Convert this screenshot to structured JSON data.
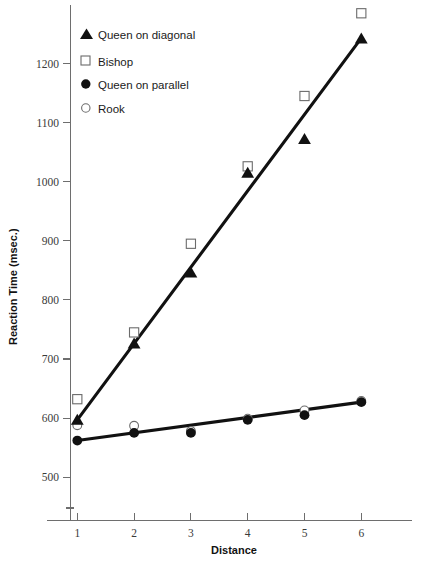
{
  "chart_data": {
    "type": "scatter",
    "title": "",
    "xlabel": "Distance",
    "ylabel": "Reaction Time (msec.)",
    "x": [
      1,
      2,
      3,
      4,
      5,
      6
    ],
    "xticklabels": [
      "1",
      "2",
      "3",
      "4",
      "5",
      "6"
    ],
    "xlim": [
      0.6,
      6.5
    ],
    "yticks": [
      500,
      600,
      700,
      800,
      900,
      1000,
      1100,
      1200
    ],
    "yticklabels": [
      "500",
      "600",
      "700",
      "800",
      "900",
      "1000",
      "1100",
      "1200"
    ],
    "ylim": [
      455,
      1300
    ],
    "grid": false,
    "legend_position": "top-left",
    "series": [
      {
        "name": "Queen on diagonal",
        "marker": "filled-triangle",
        "has_fit_line": true,
        "values": [
          598,
          727,
          847,
          1016,
          1073,
          1243
        ]
      },
      {
        "name": "Bishop",
        "marker": "open-square",
        "has_fit_line": false,
        "values": [
          632,
          745,
          895,
          1026,
          1145,
          1285
        ]
      },
      {
        "name": "Queen on parallel",
        "marker": "filled-circle",
        "has_fit_line": true,
        "values": [
          562,
          575,
          575,
          597,
          605,
          627
        ]
      },
      {
        "name": "Rook",
        "marker": "open-circle",
        "has_fit_line": false,
        "values": [
          588,
          587,
          578,
          599,
          613,
          629
        ]
      }
    ],
    "fit_lines": [
      {
        "name": "diagonal-fit",
        "x": [
          1,
          6
        ],
        "y": [
          597,
          1243
        ]
      },
      {
        "name": "parallel-fit",
        "x": [
          1,
          6
        ],
        "y": [
          562,
          627
        ]
      }
    ]
  },
  "legend": {
    "items": [
      {
        "marker": "filled-triangle",
        "label": "Queen on diagonal"
      },
      {
        "marker": "open-square",
        "label": "Bishop"
      },
      {
        "marker": "filled-circle",
        "label": "Queen on parallel"
      },
      {
        "marker": "open-circle",
        "label": "Rook"
      }
    ]
  },
  "axes": {
    "x_title": "Distance",
    "y_title": "Reaction Time (msec.)"
  },
  "colors": {
    "ink": "#111111",
    "axis": "#6e6e6e",
    "background": "#ffffff"
  }
}
